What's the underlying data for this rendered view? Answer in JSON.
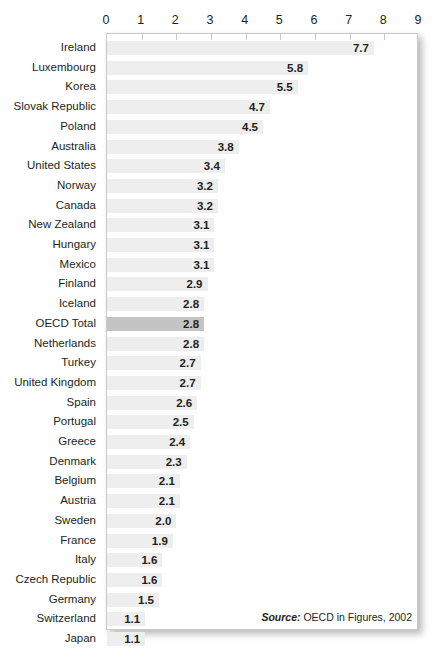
{
  "title_remnant": "",
  "source": {
    "prefix": "Source:",
    "text": " OECD in Figures, 2002"
  },
  "colors": {
    "bar": "#eeeeee",
    "bar_highlight": "#c4c4c4",
    "text": "#231f20",
    "frame": "#c9c9c9",
    "background": "#ffffff"
  },
  "chart_data": {
    "type": "bar",
    "orientation": "horizontal",
    "title": "",
    "subtitle": "",
    "xlabel": "",
    "ylabel": "",
    "xlim": [
      0,
      9
    ],
    "xticks": [
      0,
      1,
      2,
      3,
      4,
      5,
      6,
      7,
      8,
      9
    ],
    "xtick_labels": [
      "0",
      "1",
      "2",
      "3",
      "4",
      "5",
      "6",
      "7",
      "8",
      "9"
    ],
    "grid": false,
    "legend": false,
    "value_labels": true,
    "highlight_category": "OECD Total",
    "source_note": "Source: OECD in Figures, 2002",
    "categories": [
      "Ireland",
      "Luxembourg",
      "Korea",
      "Slovak Republic",
      "Poland",
      "Australia",
      "United States",
      "Norway",
      "Canada",
      "New Zealand",
      "Hungary",
      "Mexico",
      "Finland",
      "Iceland",
      "OECD Total",
      "Netherlands",
      "Turkey",
      "United Kingdom",
      "Spain",
      "Portugal",
      "Greece",
      "Denmark",
      "Belgium",
      "Austria",
      "Sweden",
      "France",
      "Italy",
      "Czech Republic",
      "Germany",
      "Switzerland",
      "Japan"
    ],
    "values": [
      7.7,
      5.8,
      5.5,
      4.7,
      4.5,
      3.8,
      3.4,
      3.2,
      3.2,
      3.1,
      3.1,
      3.1,
      2.9,
      2.8,
      2.8,
      2.8,
      2.7,
      2.7,
      2.6,
      2.5,
      2.4,
      2.3,
      2.1,
      2.1,
      2.0,
      1.9,
      1.6,
      1.6,
      1.5,
      1.1,
      1.1
    ],
    "value_labels_text": [
      "7.7",
      "5.8",
      "5.5",
      "4.7",
      "4.5",
      "3.8",
      "3.4",
      "3.2",
      "3.2",
      "3.1",
      "3.1",
      "3.1",
      "2.9",
      "2.8",
      "2.8",
      "2.8",
      "2.7",
      "2.7",
      "2.6",
      "2.5",
      "2.4",
      "2.3",
      "2.1",
      "2.1",
      "2.0",
      "1.9",
      "1.6",
      "1.6",
      "1.5",
      "1.1",
      "1.1"
    ]
  }
}
